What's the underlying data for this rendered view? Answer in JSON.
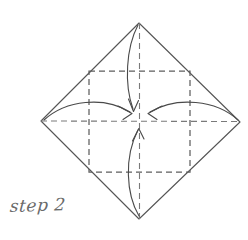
{
  "diagram": {
    "title": "step 2",
    "type": "origami-fold-instruction",
    "caption": "step 2",
    "background_color": "#ffffff",
    "stroke_color": "#555555",
    "dash_color": "#666666",
    "canvas": {
      "width": 248,
      "height": 231
    },
    "outline": {
      "name": "paper-diamond",
      "shape": "square rotated 45 degrees",
      "vertices": {
        "top": [
          139,
          23
        ],
        "right": [
          240,
          122
        ],
        "bottom": [
          139,
          219
        ],
        "left": [
          41,
          121
        ]
      }
    },
    "creases": {
      "inner_square": {
        "name": "inner-dashed-square",
        "top_left": [
          89,
          71
        ],
        "top_right": [
          190,
          71
        ],
        "bottom_right": [
          190,
          172
        ],
        "bottom_left": [
          89,
          172
        ],
        "style": "dashed"
      },
      "vertical_center_line": {
        "from": [
          139,
          23
        ],
        "to": [
          139,
          219
        ],
        "style": "dashed"
      },
      "horizontal_center_line": {
        "from": [
          41,
          121
        ],
        "to": [
          240,
          122
        ],
        "style": "dashed"
      }
    },
    "center_point": [
      140,
      121
    ],
    "arrows": [
      {
        "name": "fold-arrow-top",
        "label": "fold top corner to center",
        "from": [
          139,
          26
        ],
        "to": [
          134,
          112
        ],
        "direction": "down"
      },
      {
        "name": "fold-arrow-left",
        "label": "fold left corner to center",
        "from": [
          44,
          120
        ],
        "to": [
          131,
          115
        ],
        "direction": "right"
      },
      {
        "name": "fold-arrow-right",
        "label": "fold right corner to center",
        "from": [
          238,
          121
        ],
        "to": [
          149,
          114
        ],
        "direction": "left"
      },
      {
        "name": "fold-arrow-bottom",
        "label": "fold bottom corner to center",
        "from": [
          139,
          216
        ],
        "to": [
          140,
          128
        ],
        "direction": "up"
      }
    ]
  }
}
